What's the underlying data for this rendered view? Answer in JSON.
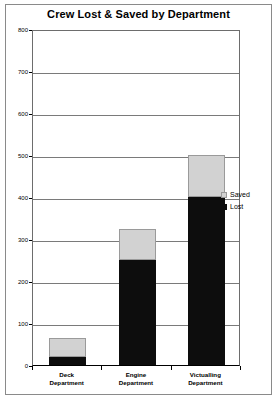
{
  "chart_data": {
    "type": "bar",
    "title": "Crew Lost & Saved by Department",
    "xlabel": "",
    "ylabel": "",
    "ylim": [
      0,
      800
    ],
    "yticks": [
      0,
      100,
      200,
      300,
      400,
      500,
      600,
      700,
      800
    ],
    "ytick_labels": [
      "0",
      "100",
      "200",
      "300",
      "400",
      "500",
      "600",
      "700",
      "800"
    ],
    "grid": true,
    "stacked": true,
    "legend_position": "right",
    "categories": [
      "Deck Department",
      "Engine Department",
      "Victualling Department"
    ],
    "category_lines": [
      [
        "Deck",
        "Department"
      ],
      [
        "Engine",
        "Department"
      ],
      [
        "Victualling",
        "Department"
      ]
    ],
    "series": [
      {
        "name": "Lost",
        "color": "#0d0d0d",
        "values": [
          20,
          250,
          400
        ]
      },
      {
        "name": "Saved",
        "color": "#d2d2d2",
        "values": [
          45,
          75,
          100
        ]
      }
    ],
    "totals": [
      65,
      325,
      500
    ]
  },
  "legend": {
    "entries": [
      {
        "label": "Saved",
        "color": "#d2d2d2"
      },
      {
        "label": "Lost",
        "color": "#0d0d0d"
      }
    ]
  }
}
